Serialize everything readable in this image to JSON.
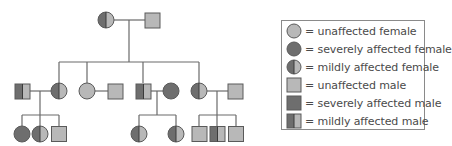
{
  "colors": {
    "unaffected": "#b8b8b8",
    "affected": "#6e6e6e",
    "outline": "#5a5a5a",
    "line": "#6a6a6a"
  },
  "legend": {
    "items": [
      {
        "symbol": "circle",
        "type": "unaffected",
        "label": "= unaffected female"
      },
      {
        "symbol": "circle",
        "type": "severe",
        "label": "= severely affected female"
      },
      {
        "symbol": "circle",
        "type": "mild",
        "label": "= mildly affected female"
      },
      {
        "symbol": "square",
        "type": "unaffected",
        "label": "= unaffected male"
      },
      {
        "symbol": "square",
        "type": "severe",
        "label": "= severely affected male"
      },
      {
        "symbol": "square",
        "type": "mild",
        "label": "= mildly affected male"
      }
    ]
  },
  "pedigree": {
    "generation1": [
      {
        "id": "I-1",
        "sex": "female",
        "status": "mild"
      },
      {
        "id": "I-2",
        "sex": "male",
        "status": "unaffected"
      }
    ],
    "generation2": [
      {
        "id": "II-1",
        "sex": "male",
        "status": "mild",
        "spouse": true
      },
      {
        "id": "II-2",
        "sex": "female",
        "status": "mild"
      },
      {
        "id": "II-3",
        "sex": "female",
        "status": "unaffected"
      },
      {
        "id": "II-4",
        "sex": "male",
        "status": "unaffected",
        "spouse": true
      },
      {
        "id": "II-5",
        "sex": "male",
        "status": "mild"
      },
      {
        "id": "II-6",
        "sex": "female",
        "status": "severe",
        "spouse": true
      },
      {
        "id": "II-7",
        "sex": "female",
        "status": "mild"
      },
      {
        "id": "II-8",
        "sex": "male",
        "status": "unaffected",
        "spouse": true
      }
    ],
    "generation3": [
      {
        "id": "III-1",
        "sex": "female",
        "status": "severe",
        "parents": "II-1 x II-2"
      },
      {
        "id": "III-2",
        "sex": "female",
        "status": "mild",
        "parents": "II-1 x II-2"
      },
      {
        "id": "III-3",
        "sex": "male",
        "status": "unaffected",
        "parents": "II-1 x II-2"
      },
      {
        "id": "III-4",
        "sex": "female",
        "status": "mild",
        "parents": "II-5 x II-6"
      },
      {
        "id": "III-5",
        "sex": "female",
        "status": "mild",
        "parents": "II-5 x II-6"
      },
      {
        "id": "III-6",
        "sex": "male",
        "status": "unaffected",
        "parents": "II-7 x II-8"
      },
      {
        "id": "III-7",
        "sex": "male",
        "status": "mild",
        "parents": "II-7 x II-8"
      },
      {
        "id": "III-8",
        "sex": "male",
        "status": "unaffected",
        "parents": "II-7 x II-8"
      }
    ]
  }
}
